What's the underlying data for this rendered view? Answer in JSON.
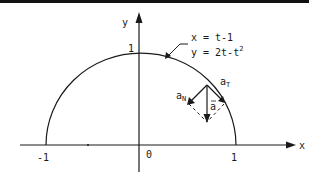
{
  "figure": {
    "type": "parametric-curve-diagram",
    "axes": {
      "x_label": "x",
      "y_label": "y",
      "x_ticks": [
        "-1",
        "0",
        "1"
      ],
      "y_ticks": [
        "1"
      ]
    },
    "curve": {
      "equation_x": "x = t-1",
      "equation_y_prefix": "y = 2t-t",
      "equation_y_exponent": "2",
      "shape": "upper semicircle of radius 1 centered at origin"
    },
    "vectors": {
      "acceleration": "a",
      "normal_base": "a",
      "normal_sub": "N",
      "tangent_base": "a",
      "tangent_sub": "T"
    },
    "colors": {
      "ink": "#1a1a1a",
      "background": "#ffffff",
      "border": "#111111"
    }
  }
}
